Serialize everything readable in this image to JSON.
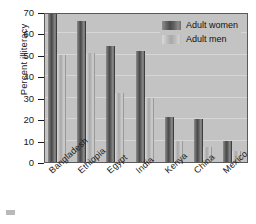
{
  "chart_data": {
    "type": "bar",
    "title": "",
    "xlabel": "",
    "ylabel": "Percent illiteracy",
    "ylim": [
      0,
      70
    ],
    "ytick_values": [
      0,
      10,
      20,
      30,
      40,
      50,
      60,
      70
    ],
    "ytick_labels": [
      "0",
      "10",
      "20",
      "30",
      "40",
      "50",
      "60",
      "70"
    ],
    "grid": true,
    "legend_position": "top-right",
    "categories": [
      "Bangladesh",
      "Ethiopia",
      "Egypt",
      "India",
      "Kenya",
      "China",
      "Mexico"
    ],
    "series": [
      {
        "name": "Adult women",
        "color": "#4a4a4a",
        "values": [
          69,
          66,
          54,
          52,
          21,
          20,
          10
        ]
      },
      {
        "name": "Adult men",
        "color": "#b8b8b8",
        "values": [
          50,
          51,
          32,
          30,
          10,
          7,
          5
        ]
      }
    ]
  },
  "legend": {
    "entries": [
      {
        "label": "Adult women",
        "swatch": "women"
      },
      {
        "label": "Adult men",
        "swatch": "men"
      }
    ]
  },
  "colors": {
    "plot_background": "#c3c3c3",
    "page_background": "#ffffff",
    "axis": "#1a1a1a",
    "gridline": "#d6d6d6",
    "women_bar": "#4a4a4a",
    "men_bar": "#b8b8b8"
  }
}
